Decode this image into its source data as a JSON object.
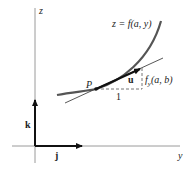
{
  "figure": {
    "axes": {
      "vertical_label": "z",
      "horizontal_label": "y"
    },
    "unit_vectors": {
      "k_label": "k",
      "j_label": "j"
    },
    "curve": {
      "label": "z = f(a, y)"
    },
    "point": {
      "label": "P"
    },
    "tangent_vector": {
      "label": "u"
    },
    "run_label": "1",
    "rise_label_main": "f",
    "rise_label_sub": "y",
    "rise_label_args": "(a, b)",
    "colors": {
      "axis": "#9a9a9a",
      "curve": "#555555",
      "vector": "#111111",
      "dashed": "#666666"
    }
  }
}
